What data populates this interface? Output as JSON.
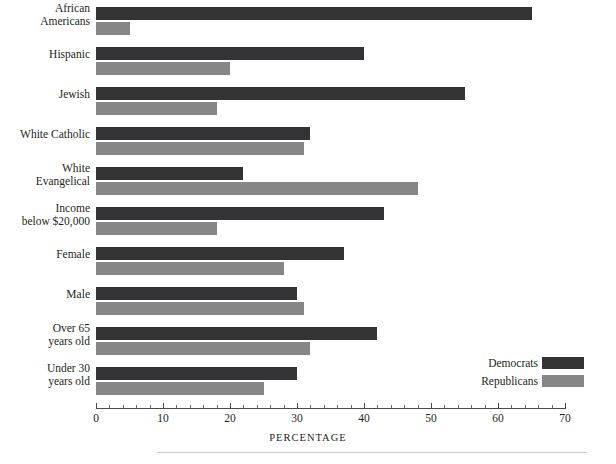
{
  "chart_data": {
    "type": "bar",
    "orientation": "horizontal",
    "title": "",
    "xlabel": "PERCENTAGE",
    "ylabel": "",
    "xlim": [
      0,
      70
    ],
    "grid": false,
    "legend_position": "bottom-right",
    "categories": [
      "African\nAmericans",
      "Hispanic",
      "Jewish",
      "White Catholic",
      "White\nEvangelical",
      "Income\nbelow $20,000",
      "Female",
      "Male",
      "Over 65\nyears old",
      "Under 30\nyears old"
    ],
    "category_lines": [
      [
        "African",
        "Americans"
      ],
      [
        "Hispanic"
      ],
      [
        "Jewish"
      ],
      [
        "White Catholic"
      ],
      [
        "White",
        "Evangelical"
      ],
      [
        "Income",
        "below $20,000"
      ],
      [
        "Female"
      ],
      [
        "Male"
      ],
      [
        "Over 65",
        "years old"
      ],
      [
        "Under 30",
        "years old"
      ]
    ],
    "series": [
      {
        "name": "Democrats",
        "color": "#333335",
        "values": [
          65,
          40,
          55,
          32,
          22,
          43,
          37,
          30,
          42,
          30
        ]
      },
      {
        "name": "Republicans",
        "color": "#868686",
        "values": [
          5,
          20,
          18,
          31,
          48,
          18,
          28,
          31,
          32,
          25
        ]
      }
    ],
    "x_ticks": [
      0,
      10,
      20,
      30,
      40,
      50,
      60,
      70
    ],
    "x_tick_labels": [
      "0",
      "10",
      "20",
      "30",
      "40",
      "50",
      "60",
      "70"
    ],
    "x_minor_tick_interval": 2
  },
  "legend": {
    "items": [
      {
        "label": "Democrats",
        "color": "#333335"
      },
      {
        "label": "Republicans",
        "color": "#868686"
      }
    ]
  },
  "axis": {
    "title": "PERCENTAGE"
  }
}
